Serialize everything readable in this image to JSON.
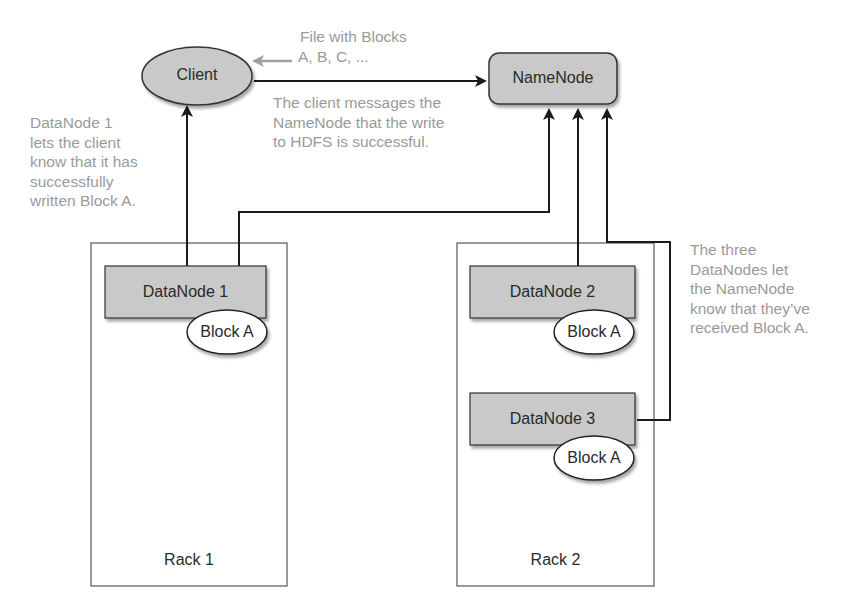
{
  "diagram": {
    "colors": {
      "node_fill": "#c9c9c9",
      "node_stroke": "#333333",
      "block_fill": "#ffffff",
      "rack_stroke": "#555555",
      "annotation_text": "#9a9a9a",
      "arrow": "#1a1a1a",
      "file_arrow": "#a0a0a0"
    },
    "nodes": {
      "client": {
        "label": "Client",
        "shape": "ellipse"
      },
      "namenode": {
        "label": "NameNode",
        "shape": "rounded-rect"
      },
      "datanode1": {
        "label": "DataNode 1",
        "block": "Block A",
        "rack": "Rack 1"
      },
      "datanode2": {
        "label": "DataNode 2",
        "block": "Block A",
        "rack": "Rack 2"
      },
      "datanode3": {
        "label": "DataNode 3",
        "block": "Block A",
        "rack": "Rack 2"
      }
    },
    "racks": [
      {
        "label": "Rack 1"
      },
      {
        "label": "Rack 2"
      }
    ],
    "annotations": {
      "file": [
        "File with Blocks",
        "A, B, C, ..."
      ],
      "client_to_namenode": [
        "The client messages the",
        "NameNode that the write",
        "to HDFS is successful."
      ],
      "datanode1_to_client": [
        "DataNode 1",
        "lets the client",
        "know that it has",
        "successfully",
        "written Block A."
      ],
      "datanodes_to_namenode": [
        "The three",
        "DataNodes let",
        "the NameNode",
        "know that they’ve",
        "received Block A."
      ]
    },
    "edges": [
      {
        "from": "file",
        "to": "client",
        "style": "gray-arrow"
      },
      {
        "from": "client",
        "to": "namenode"
      },
      {
        "from": "datanode1",
        "to": "client"
      },
      {
        "from": "datanode1",
        "to": "namenode"
      },
      {
        "from": "datanode2",
        "to": "namenode"
      },
      {
        "from": "datanode3",
        "to": "namenode"
      }
    ]
  }
}
